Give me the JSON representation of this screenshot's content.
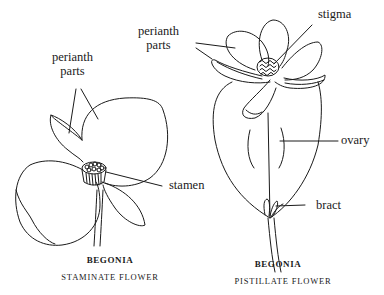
{
  "diagram": {
    "left_flower": {
      "title": "BEGONIA",
      "subtitle": "STAMINATE FLOWER",
      "labels": {
        "perianth": "perianth",
        "parts": "parts",
        "stamen": "stamen"
      }
    },
    "right_flower": {
      "title": "BEGONIA",
      "subtitle": "PISTILLATE FLOWER",
      "labels": {
        "perianth": "perianth",
        "parts": "parts",
        "stigma": "stigma",
        "ovary": "ovary",
        "bract": "bract"
      }
    },
    "colors": {
      "line": "#1a1a1a",
      "background": "#ffffff"
    }
  }
}
